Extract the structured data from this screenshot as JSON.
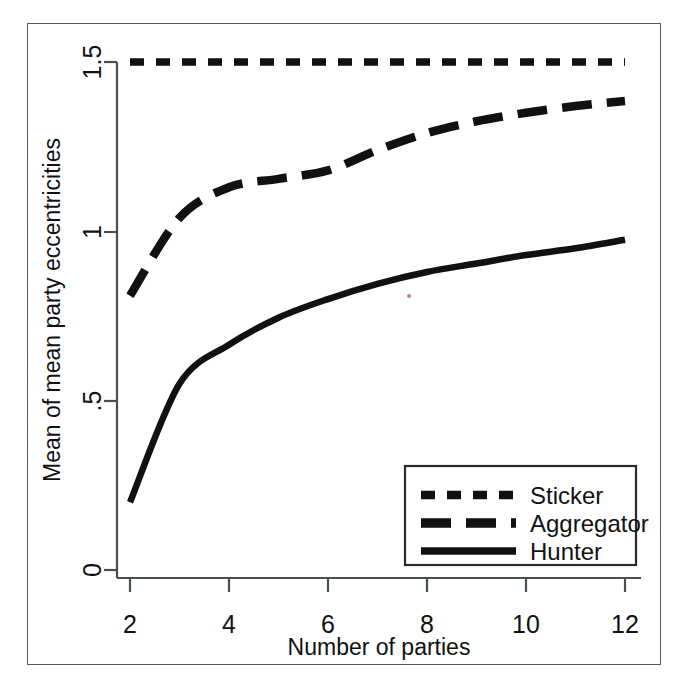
{
  "chart_data": {
    "type": "line",
    "title": "",
    "xlabel": "Number of parties",
    "ylabel": "Mean of mean party eccentricities",
    "x": [
      2,
      3,
      4,
      5,
      6,
      7,
      8,
      9,
      10,
      11,
      12
    ],
    "xlim": [
      2,
      12
    ],
    "ylim": [
      0,
      1.5
    ],
    "xticks": [
      2,
      4,
      6,
      8,
      10,
      12
    ],
    "xtick_labels": [
      "2",
      "4",
      "6",
      "8",
      "10",
      "12"
    ],
    "yticks": [
      0,
      0.5,
      1,
      1.5
    ],
    "ytick_labels": [
      "0",
      ".5",
      "1",
      "1.5"
    ],
    "grid": false,
    "legend_position": "lower right",
    "series": [
      {
        "name": "Sticker",
        "style": "short-dashed",
        "color": "#111111",
        "values": [
          1.5,
          1.5,
          1.5,
          1.5,
          1.5,
          1.5,
          1.5,
          1.5,
          1.5,
          1.5,
          1.5
        ]
      },
      {
        "name": "Aggregator",
        "style": "long-dashed",
        "color": "#111111",
        "values": [
          0.81,
          1.04,
          1.13,
          1.155,
          1.18,
          1.24,
          1.29,
          1.325,
          1.35,
          1.37,
          1.385
        ]
      },
      {
        "name": "Hunter",
        "style": "solid",
        "color": "#111111",
        "values": [
          0.2,
          0.55,
          0.665,
          0.745,
          0.8,
          0.845,
          0.88,
          0.905,
          0.93,
          0.95,
          0.975
        ]
      }
    ]
  },
  "axes": {
    "x_title": "Number of parties",
    "y_title": "Mean of mean party eccentricities",
    "x_tick_labels": [
      "2",
      "4",
      "6",
      "8",
      "10",
      "12"
    ],
    "y_tick_labels": [
      "1.5",
      "1",
      ".5",
      "0"
    ]
  },
  "legend": {
    "entries": [
      {
        "label": "Sticker"
      },
      {
        "label": "Aggregator"
      },
      {
        "label": "Hunter"
      }
    ]
  }
}
